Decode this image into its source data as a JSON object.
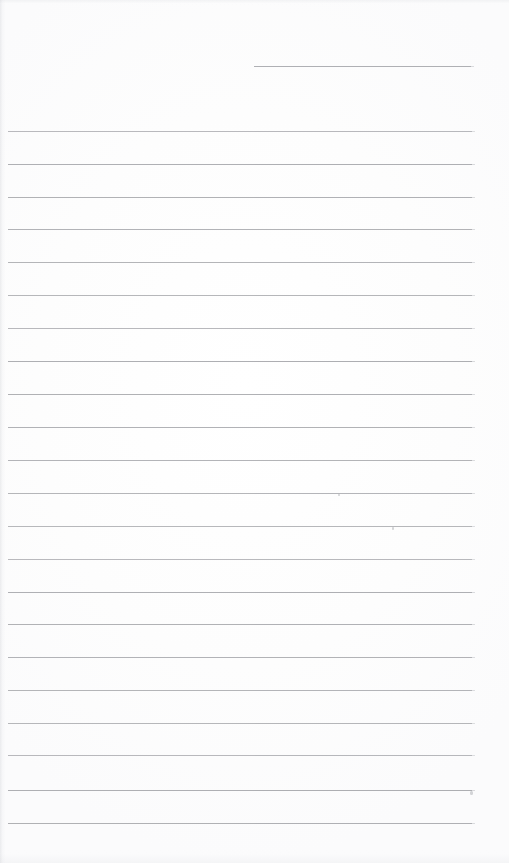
{
  "document": {
    "kind": "scanned-ruled-notebook-page",
    "title": "Blank Ruled Page",
    "page_width": 509,
    "page_height": 863,
    "background_color": "#fdfdfd",
    "rule_color": "#a9aaae",
    "rule_thickness_px": 1,
    "text_content": "",
    "is_blank": "true"
  },
  "ruling": {
    "line_spacing_px": 32.6,
    "full_rule_left_px": 8,
    "full_rule_right_px": 472,
    "full_rule_count": 22,
    "header_rule_count": 1
  },
  "header_rule": {
    "name": "date-rule",
    "x": 254,
    "y": 66,
    "width": 217
  },
  "rules": [
    {
      "y": 131,
      "x": 8,
      "width": 464
    },
    {
      "y": 164,
      "x": 8,
      "width": 464
    },
    {
      "y": 197,
      "x": 8,
      "width": 464
    },
    {
      "y": 229,
      "x": 8,
      "width": 464
    },
    {
      "y": 262,
      "x": 8,
      "width": 464
    },
    {
      "y": 295,
      "x": 8,
      "width": 464
    },
    {
      "y": 328,
      "x": 8,
      "width": 464
    },
    {
      "y": 361,
      "x": 8,
      "width": 464
    },
    {
      "y": 394,
      "x": 8,
      "width": 464
    },
    {
      "y": 427,
      "x": 8,
      "width": 464
    },
    {
      "y": 460,
      "x": 8,
      "width": 464
    },
    {
      "y": 493,
      "x": 8,
      "width": 464
    },
    {
      "y": 526,
      "x": 8,
      "width": 464
    },
    {
      "y": 559,
      "x": 8,
      "width": 464
    },
    {
      "y": 592,
      "x": 8,
      "width": 464
    },
    {
      "y": 624,
      "x": 8,
      "width": 464
    },
    {
      "y": 657,
      "x": 8,
      "width": 464
    },
    {
      "y": 690,
      "x": 8,
      "width": 464
    },
    {
      "y": 723,
      "x": 8,
      "width": 464
    },
    {
      "y": 755,
      "x": 8,
      "width": 464
    },
    {
      "y": 790,
      "x": 8,
      "width": 464
    },
    {
      "y": 823,
      "x": 8,
      "width": 464
    }
  ],
  "marks": [
    {
      "name": "speckle-a",
      "x": 338,
      "y": 494,
      "w": 2,
      "h": 2
    },
    {
      "name": "speckle-b",
      "x": 392,
      "y": 527,
      "w": 2,
      "h": 3
    },
    {
      "name": "speckle-c",
      "x": 470,
      "y": 791,
      "w": 3,
      "h": 4
    }
  ]
}
